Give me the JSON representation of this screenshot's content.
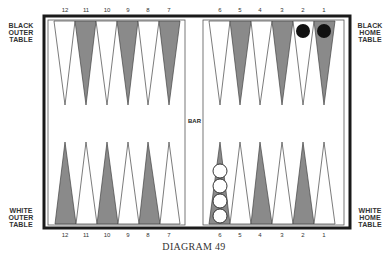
{
  "labels": {
    "black_outer": [
      "BLACK",
      "OUTER",
      "TABLE"
    ],
    "black_home": [
      "BLACK",
      "HOME",
      "TABLE"
    ],
    "white_outer": [
      "WHITE",
      "OUTER",
      "TABLE"
    ],
    "white_home": [
      "WHITE",
      "HOME",
      "TABLE"
    ],
    "bar": "BAR",
    "caption": "DIAGRAM 49"
  },
  "top_numbers_left": [
    "12",
    "11",
    "10",
    "9",
    "8",
    "7"
  ],
  "top_numbers_right": [
    "6",
    "5",
    "4",
    "3",
    "2",
    "1"
  ],
  "bottom_numbers_left": [
    "12",
    "11",
    "10",
    "9",
    "8",
    "7"
  ],
  "bottom_numbers_right": [
    "6",
    "5",
    "4",
    "3",
    "2",
    "1"
  ],
  "colors": {
    "board_border": "#1a1a1a",
    "point_dark": "#8a8a8a",
    "point_light": "#ffffff",
    "black_checker": "#111111",
    "white_checker": "#ffffff"
  },
  "checkers": [
    {
      "color": "black",
      "point": "black-1",
      "count": 1
    },
    {
      "color": "black",
      "point": "black-2",
      "count": 1
    },
    {
      "color": "white",
      "point": "white-6",
      "count": 4
    }
  ]
}
